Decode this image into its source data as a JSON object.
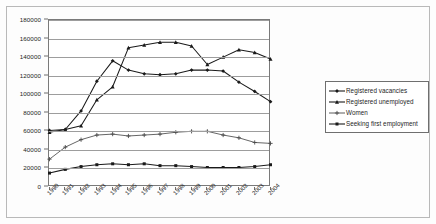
{
  "chart_data": {
    "type": "line",
    "title": "",
    "subtitle": "",
    "xlabel": "",
    "ylabel": "",
    "grid": true,
    "legend_position": "right",
    "ylim": [
      0,
      180000
    ],
    "ytick_step": 20000,
    "yticks": [
      "180000",
      "160000",
      "140000",
      "120000",
      "100000",
      "80000",
      "60000",
      "40000",
      "20000",
      "0"
    ],
    "ytick_values": [
      180000,
      160000,
      140000,
      120000,
      100000,
      80000,
      60000,
      40000,
      20000,
      0
    ],
    "categories": [
      "1990",
      "1991",
      "1992",
      "1993",
      "1994",
      "1995",
      "1996",
      "1997",
      "1998",
      "1999",
      "2000",
      "2001",
      "2002",
      "2003",
      "2004"
    ],
    "series": [
      {
        "name": "Registered vacancies",
        "marker": "diamond",
        "color": "#1a1a1a",
        "values": [
          61000,
          62000,
          82000,
          114000,
          136000,
          126000,
          122000,
          121000,
          122000,
          126000,
          126000,
          125000,
          113000,
          103000,
          92000
        ]
      },
      {
        "name": "Registered unemployed",
        "marker": "triangle",
        "color": "#1a1a1a",
        "values": [
          59000,
          62000,
          66000,
          94000,
          108000,
          150000,
          153000,
          156000,
          156000,
          152000,
          132000,
          140000,
          148000,
          145000,
          138000
        ]
      },
      {
        "name": "Women",
        "marker": "plus",
        "color": "#4a4a4a",
        "values": [
          30000,
          43000,
          51000,
          56000,
          57000,
          55000,
          56000,
          57000,
          59000,
          60000,
          60000,
          56000,
          53000,
          48000,
          47000
        ]
      },
      {
        "name": "Seeking first employment",
        "marker": "square",
        "color": "#1a1a1a",
        "values": [
          15000,
          19000,
          22000,
          24000,
          25000,
          24000,
          25000,
          23000,
          23000,
          22000,
          21000,
          21000,
          21000,
          22000,
          24000
        ]
      }
    ]
  },
  "legend": {
    "items": [
      {
        "label": "Registered vacancies"
      },
      {
        "label": "Registered unemployed"
      },
      {
        "label": "Women"
      },
      {
        "label": "Seeking first employment"
      }
    ]
  }
}
